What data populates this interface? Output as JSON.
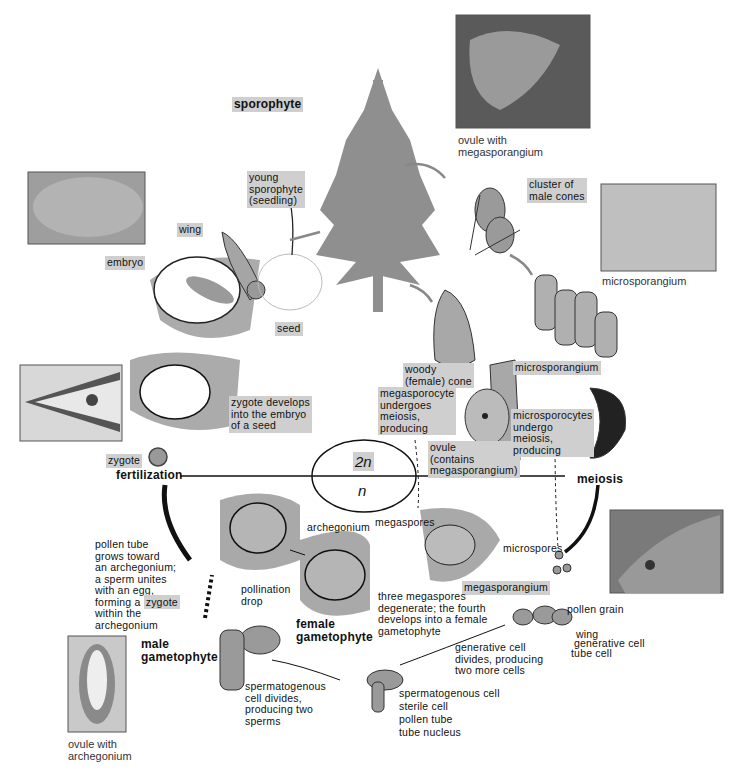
{
  "diagram": {
    "phases": {
      "sporophyte": "sporophyte",
      "male_gametophyte": "male\ngametophyte",
      "female_gametophyte": "female\ngametophyte"
    },
    "ploidy": {
      "diploid": "2n",
      "haploid": "n"
    },
    "events": {
      "fertilization": "fertilization",
      "meiosis": "meiosis"
    }
  },
  "labels": {
    "young_sporophyte": "young\nsporophyte\n(seedling)",
    "wing_seed": "wing",
    "embryo": "embryo",
    "seed": "seed",
    "cluster_male_cones": "cluster of\nmale cones",
    "woody_cone": "woody\n(female) cone",
    "microsporangium_drawing": "microsporangium",
    "megasporocyte": "megasporocyte\nundergoes\nmeiosis,\nproducing",
    "ovule": "ovule\n(contains\nmegasporangium)",
    "microsporocytes": "microsporocytes\nundergo\nmeiosis,\nproducing",
    "zygote_develops": "zygote develops\ninto the embryo\nof a seed",
    "zygote": "zygote",
    "pollen_tube_text_a": "pollen tube\ngrows toward\nan archegonium;\na sperm unites\nwith an egg,\nforming a ",
    "pollen_tube_zygote": "zygote",
    "pollen_tube_text_b": "within the\narchegonium",
    "archegonium": "archegonium",
    "pollination_drop": "pollination\ndrop",
    "megaspores": "megaspores",
    "megasporangium": "megasporangium",
    "three_megaspores": "three megaspores\ndegenerate; the fourth\ndevelops into a female\ngametophyte",
    "microspores": "microspores",
    "pollen_grain": "pollen grain",
    "wing_pollen": "wing",
    "generative_cell": "generative cell",
    "tube_cell": "tube cell",
    "generative_divides": "generative cell\ndivides, producing\ntwo more cells",
    "spermatogenous_cell": "spermatogenous cell",
    "sterile_cell": "sterile cell",
    "pollen_tube": "pollen tube",
    "tube_nucleus": "tube nucleus",
    "spermatogenous_divides": "spermatogenous\ncell divides,\nproducing two\nsperms"
  },
  "photos": {
    "ovule_megasporangium": "ovule with\nmegasporangium",
    "microsporangium": "microsporangium",
    "ovule_archegonium": "ovule with\narchegonium"
  },
  "colors": {
    "tissue": "#a9a9a9",
    "label_bg": "#cfcfcf",
    "tree": "#8c8c8c",
    "line": "#111111"
  }
}
